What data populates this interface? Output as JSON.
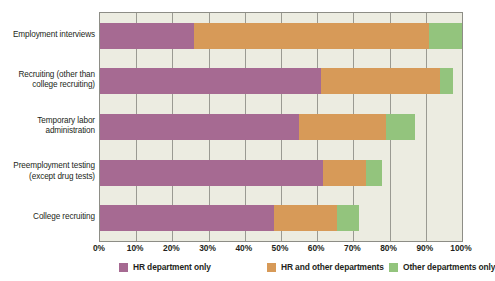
{
  "chart_data": {
    "type": "bar",
    "orientation": "horizontal",
    "stacked": true,
    "stack_mode": "absolute-percent",
    "title": "",
    "subtitle": "",
    "xlabel": "",
    "ylabel": "",
    "xlim": [
      0,
      100
    ],
    "grid": true,
    "legend_position": "bottom",
    "categories": [
      "Employment interviews",
      "Recruiting (other than college recruiting)",
      "Temporary labor administration",
      "Preemployment testing (except drug tests)",
      "College recruiting"
    ],
    "category_lines": [
      [
        "Employment interviews"
      ],
      [
        "Recruiting (other than",
        "college recruiting)"
      ],
      [
        "Temporary labor",
        "administration"
      ],
      [
        "Preemployment testing",
        "(except drug tests)"
      ],
      [
        "College recruiting"
      ]
    ],
    "xticks": [
      0,
      10,
      20,
      30,
      40,
      50,
      60,
      70,
      80,
      90,
      100
    ],
    "xticklabels": [
      "0%",
      "10%",
      "20%",
      "30%",
      "40%",
      "50%",
      "60%",
      "70%",
      "80%",
      "90%",
      "100%"
    ],
    "series": [
      {
        "name": "HR department only",
        "color": "#a66a92",
        "values": [
          26,
          61,
          55,
          61.5,
          48
        ]
      },
      {
        "name": "HR and other departments",
        "color": "#d79a58",
        "values": [
          65,
          33,
          24,
          12,
          17.5
        ]
      },
      {
        "name": "Other departments only",
        "color": "#93c47d",
        "values": [
          9,
          3.5,
          8,
          4.5,
          6
        ]
      }
    ],
    "plot_background": "#ecece1",
    "gridline_color": "#9a9a92"
  }
}
